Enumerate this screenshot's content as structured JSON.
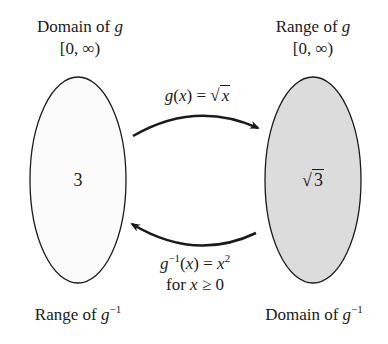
{
  "left_set": {
    "title": "Domain of g",
    "title_prefix": "Domain of ",
    "title_var": "g",
    "interval": "[0, ∞)",
    "element": "3",
    "bottom_label_prefix": "Range of ",
    "bottom_label_var": "g",
    "bottom_label_exp": "−1",
    "fill": "#fbfbfb"
  },
  "right_set": {
    "title_prefix": "Range of ",
    "title_var": "g",
    "interval": "[0, ∞)",
    "element_radical": "√",
    "element_radicand": "3",
    "bottom_label_prefix": "Domain of ",
    "bottom_label_var": "g",
    "bottom_label_exp": "−1",
    "fill": "#dcdcdc"
  },
  "forward_map": {
    "func": "g",
    "arg": "(x)",
    "arg_var": "x",
    "equals": " = ",
    "radical": "√",
    "radicand": "x"
  },
  "inverse_map": {
    "func": "g",
    "exp": "−1",
    "arg_open": "(",
    "arg_var": "x",
    "arg_close": ")",
    "equals": " = ",
    "rhs_var": "x",
    "rhs_exp": "2",
    "condition_prefix": "for ",
    "condition_var": "x",
    "condition_rest": " ≥ 0"
  },
  "colors": {
    "stroke": "#1a1a1a",
    "left_fill": "#fbfbfb",
    "right_fill": "#dcdcdc"
  }
}
